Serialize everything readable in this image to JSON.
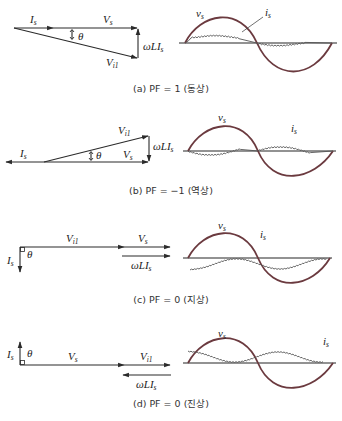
{
  "figure": {
    "panels": [
      {
        "id": "a",
        "caption": "(a) PF = 1 (동상)",
        "phasor_labels": {
          "Is": "I",
          "Is_sub": "s",
          "Vs": "V",
          "Vs_sub": "s",
          "Vi1": "V",
          "Vi1_sub": "i1",
          "theta": "θ",
          "wLIs": "ωLI",
          "wLIs_sub": "s"
        },
        "wave_labels": {
          "vs": "v",
          "vs_sub": "s",
          "is": "i",
          "is_sub": "s"
        }
      },
      {
        "id": "b",
        "caption": "(b) PF = −1 (역상)",
        "phasor_labels": {
          "Is": "I",
          "Is_sub": "s",
          "Vs": "V",
          "Vs_sub": "s",
          "Vi1": "V",
          "Vi1_sub": "i1",
          "theta": "θ",
          "wLIs": "ωLI",
          "wLIs_sub": "s"
        },
        "wave_labels": {
          "vs": "v",
          "vs_sub": "s",
          "is": "i",
          "is_sub": "s"
        }
      },
      {
        "id": "c",
        "caption": "(c) PF = 0 (지상)",
        "phasor_labels": {
          "Is": "I",
          "Is_sub": "s",
          "Vs": "V",
          "Vs_sub": "s",
          "Vi1": "V",
          "Vi1_sub": "i1",
          "theta": "θ",
          "wLIs": "ωLI",
          "wLIs_sub": "s"
        },
        "wave_labels": {
          "vs": "v",
          "vs_sub": "s",
          "is": "i",
          "is_sub": "s"
        }
      },
      {
        "id": "d",
        "caption": "(d) PF = 0 (진상)",
        "phasor_labels": {
          "Is": "I",
          "Is_sub": "s",
          "Vs": "V",
          "Vs_sub": "s",
          "Vi1": "V",
          "Vi1_sub": "i1",
          "theta": "θ",
          "wLIs": "ωLI",
          "wLIs_sub": "s"
        },
        "wave_labels": {
          "vs": "v",
          "vs_sub": "s",
          "is": "i",
          "is_sub": "s"
        }
      }
    ],
    "colors": {
      "voltage_wave": "#6b3a3f",
      "current_wave": "#555555",
      "axis": "#6e6e6e",
      "phasor": "#2a2a2a"
    }
  }
}
